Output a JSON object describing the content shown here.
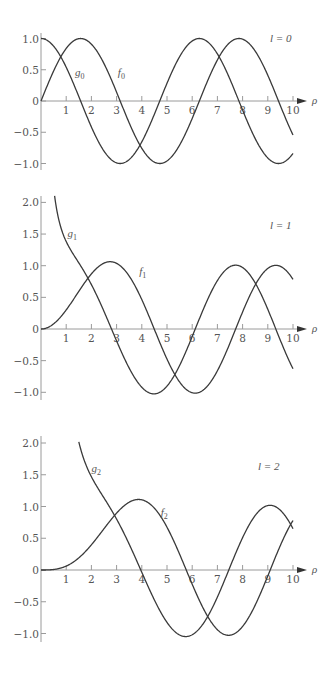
{
  "chart_data": [
    {
      "type": "line",
      "panel_label": "l = 0",
      "xlabel": "ρ",
      "ylabel": "",
      "xlim": [
        0,
        10
      ],
      "ylim": [
        -1.0,
        1.0
      ],
      "x_ticks": [
        "1",
        "2",
        "3",
        "4",
        "5",
        "6",
        "7",
        "8",
        "9",
        "10"
      ],
      "y_ticks": [
        "1.0",
        "0.5",
        "0",
        "-0.5",
        "-1.0"
      ],
      "y_tick_values": [
        1.0,
        0.5,
        0,
        -0.5,
        -1.0
      ],
      "grid": false,
      "series": [
        {
          "name": "f0",
          "label": "f",
          "sub": "0",
          "formula": "f0",
          "label_pos": [
            3.05,
            0.4
          ],
          "x": [
            0,
            0.5,
            1,
            1.5,
            2,
            2.5,
            3,
            3.5,
            4,
            4.5,
            5,
            5.5,
            6,
            6.5,
            7,
            7.5,
            8,
            8.5,
            9,
            9.5,
            10
          ],
          "values": [
            0,
            0.479,
            0.841,
            0.997,
            0.909,
            0.598,
            0.141,
            -0.351,
            -0.757,
            -0.978,
            -0.959,
            -0.706,
            -0.279,
            0.215,
            0.657,
            0.938,
            0.989,
            0.798,
            0.412,
            -0.075,
            -0.544
          ]
        },
        {
          "name": "g0",
          "label": "g",
          "sub": "0",
          "formula": "g0",
          "label_pos": [
            1.35,
            0.4
          ],
          "x": [
            0,
            0.5,
            1,
            1.5,
            2,
            2.5,
            3,
            3.5,
            4,
            4.5,
            5,
            5.5,
            6,
            6.5,
            7,
            7.5,
            8,
            8.5,
            9,
            9.5,
            10
          ],
          "values": [
            1,
            0.878,
            0.54,
            0.071,
            -0.416,
            -0.801,
            -0.99,
            -0.936,
            -0.654,
            -0.211,
            0.284,
            0.709,
            0.96,
            0.977,
            0.754,
            0.347,
            -0.146,
            -0.602,
            -0.911,
            -0.997,
            -0.839
          ]
        }
      ]
    },
    {
      "type": "line",
      "panel_label": "l = 1",
      "xlabel": "ρ",
      "ylabel": "",
      "xlim": [
        0,
        10
      ],
      "ylim": [
        -1.0,
        2.0
      ],
      "x_ticks": [
        "1",
        "2",
        "3",
        "4",
        "5",
        "6",
        "7",
        "8",
        "9",
        "10"
      ],
      "y_ticks": [
        "2.0",
        "1.5",
        "1.0",
        "0.5",
        "0",
        "-0.5",
        "-1.0"
      ],
      "y_tick_values": [
        2.0,
        1.5,
        1.0,
        0.5,
        0,
        -0.5,
        -1.0
      ],
      "grid": false,
      "series": [
        {
          "name": "f1",
          "label": "f",
          "sub": "1",
          "formula": "f1",
          "label_pos": [
            3.9,
            0.85
          ],
          "x": [
            0,
            0.5,
            1,
            1.5,
            2,
            2.5,
            3,
            3.5,
            4,
            4.5,
            5,
            5.5,
            6,
            6.5,
            7,
            7.5,
            8,
            8.5,
            9,
            9.5,
            10
          ],
          "values": [
            0,
            0.08,
            0.301,
            0.594,
            0.871,
            1.04,
            1.037,
            0.836,
            0.465,
            -0.006,
            -0.476,
            -0.837,
            -1.007,
            -0.944,
            -0.66,
            -0.222,
            0.27,
            0.696,
            0.957,
            0.989,
            0.785
          ]
        },
        {
          "name": "g1",
          "label": "g",
          "sub": "1",
          "formula": "g1",
          "label_pos": [
            1.05,
            1.45
          ],
          "x": [
            0.5,
            1,
            1.5,
            2,
            2.5,
            3,
            3.5,
            4,
            4.5,
            5,
            5.5,
            6,
            6.5,
            7,
            7.5,
            8,
            8.5,
            9,
            9.5,
            10
          ],
          "values": [
            2.234,
            1.381,
            1.044,
            0.701,
            0.278,
            -0.189,
            -0.618,
            -0.921,
            -1.025,
            -0.902,
            -0.577,
            -0.119,
            0.365,
            0.765,
            0.984,
            0.971,
            0.727,
            0.311,
            -0.18,
            -0.628
          ]
        }
      ]
    },
    {
      "type": "line",
      "panel_label": "l = 2",
      "xlabel": "ρ",
      "ylabel": "",
      "xlim": [
        0,
        10
      ],
      "ylim": [
        -1.0,
        2.0
      ],
      "x_ticks": [
        "1",
        "2",
        "3",
        "4",
        "5",
        "6",
        "7",
        "8",
        "9",
        "10"
      ],
      "y_ticks": [
        "2.0",
        "1.5",
        "1.0",
        "0.5",
        "0",
        "-0.5",
        "-1.0"
      ],
      "y_tick_values": [
        2.0,
        1.5,
        1.0,
        0.5,
        0,
        -0.5,
        -1.0
      ],
      "grid": false,
      "series": [
        {
          "name": "f2",
          "label": "f",
          "sub": "2",
          "formula": "f2",
          "label_pos": [
            4.75,
            0.85
          ],
          "x": [
            0,
            1,
            1.5,
            2,
            2.5,
            3,
            3.5,
            4,
            4.5,
            5,
            5.5,
            6,
            6.5,
            7,
            7.5,
            8,
            8.5,
            9,
            9.5,
            10
          ],
          "values": [
            0,
            0.062,
            0.19,
            0.397,
            0.65,
            0.896,
            1.067,
            1.106,
            0.974,
            0.674,
            0.249,
            -0.224,
            -0.651,
            -0.94,
            -1.027,
            -0.888,
            -0.553,
            -0.093,
            0.388,
            0.78
          ]
        },
        {
          "name": "g2",
          "label": "g",
          "sub": "2",
          "formula": "g2",
          "label_pos": [
            2.0,
            1.55
          ],
          "x": [
            1.5,
            2,
            2.5,
            3,
            3.5,
            4,
            4.5,
            5,
            5.5,
            6,
            6.5,
            7,
            7.5,
            8,
            8.5,
            9,
            9.5,
            10
          ],
          "values": [
            2.018,
            1.468,
            1.135,
            0.801,
            0.406,
            -0.037,
            -0.472,
            -0.825,
            -1.024,
            -1.02,
            -0.809,
            -0.426,
            0.046,
            0.51,
            0.859,
            1.014,
            0.94,
            0.651
          ]
        }
      ]
    }
  ],
  "layout": {
    "panels": [
      {
        "x0": 41,
        "px_per_x": 25.2,
        "y_zero": 101,
        "px_per_y": 62.5,
        "y_top": 33,
        "y_bottom": 170,
        "label_x": 270,
        "label_y": 42
      },
      {
        "x0": 41,
        "px_per_x": 25.2,
        "y_zero": 329,
        "px_per_y": 63.3,
        "y_top": 196,
        "y_bottom": 400,
        "label_x": 270,
        "label_y": 229
      },
      {
        "x0": 41,
        "px_per_x": 25.2,
        "y_zero": 570,
        "px_per_y": 63.5,
        "y_top": 436,
        "y_bottom": 642,
        "label_x": 258,
        "label_y": 470
      }
    ],
    "axis_arrow_end": 307
  }
}
